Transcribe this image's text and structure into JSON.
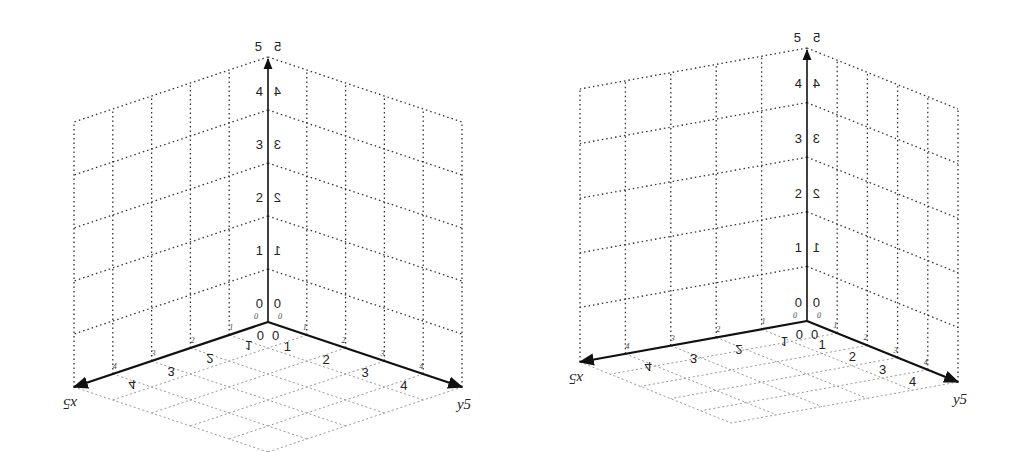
{
  "figure": {
    "panels": [
      {
        "id": "left",
        "origin": [
          268,
          322
        ],
        "z_unit": 53,
        "x_vec": [
          -38.8,
          13
        ],
        "y_vec": [
          38.8,
          13
        ],
        "z_ticks": [
          "0",
          "1",
          "2",
          "3",
          "4"
        ],
        "z_ticks_mirrored": [
          "0",
          "1",
          "2",
          "3",
          "4"
        ],
        "x_ticks": [
          "0",
          "1",
          "2",
          "3",
          "4"
        ],
        "y_ticks": [
          "0",
          "1",
          "2",
          "3",
          "4"
        ],
        "axis_labels": {
          "z_left": "5",
          "z_right": "5",
          "x": "x5",
          "y": "y5"
        }
      },
      {
        "id": "right",
        "origin": [
          807,
          321
        ],
        "z_unit": 54.6,
        "x_vec": [
          -45.4,
          8.2
        ],
        "y_vec": [
          30.2,
          12.2
        ],
        "z_ticks": [
          "0",
          "1",
          "2",
          "3",
          "4"
        ],
        "z_ticks_mirrored": [
          "0",
          "1",
          "2",
          "3",
          "4"
        ],
        "x_ticks": [
          "0",
          "1",
          "2",
          "3",
          "4"
        ],
        "y_ticks": [
          "0",
          "1",
          "2",
          "3",
          "4"
        ],
        "axis_labels": {
          "z_left": "5",
          "z_right": "5",
          "x": "x5",
          "y": "y5"
        }
      }
    ],
    "grid_units": 5,
    "colors": {
      "axis": "#111111",
      "wall_grid": "#333333",
      "floor_grid": "#999999",
      "background": "#ffffff"
    }
  }
}
